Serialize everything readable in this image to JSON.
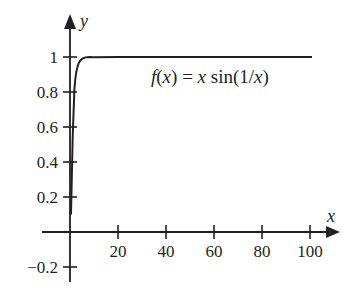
{
  "chart_data": {
    "type": "line",
    "title": "",
    "xlabel": "x",
    "ylabel": "y",
    "xlim": [
      0,
      100
    ],
    "ylim": [
      -0.2,
      1
    ],
    "grid": false,
    "x_ticks": [
      20,
      40,
      60,
      80,
      100
    ],
    "x_tick_labels": [
      "20",
      "40",
      "60",
      "80",
      "100"
    ],
    "y_ticks": [
      -0.2,
      0.2,
      0.4,
      0.6,
      0.8,
      1
    ],
    "y_tick_labels": [
      "−0.2",
      "0.2",
      "0.4",
      "0.6",
      "0.8",
      "1"
    ],
    "series": [
      {
        "name": "f(x) = x sin(1/x)",
        "function": "x*sin(1/x)",
        "x": [
          0.05,
          0.1,
          0.2,
          0.3,
          0.4,
          0.5,
          0.7,
          1,
          1.5,
          2,
          3,
          4,
          5,
          7,
          10,
          20,
          40,
          60,
          80,
          100
        ],
        "values": [
          0.0456,
          -0.0544,
          0.1918,
          0.1145,
          0.2394,
          0.4546,
          0.691,
          0.8415,
          0.9276,
          0.9589,
          0.9816,
          0.9896,
          0.9933,
          0.9966,
          0.9983,
          0.9996,
          0.9999,
          1.0,
          1.0,
          1.0
        ]
      }
    ],
    "annotations": [
      {
        "text": "f(x) = x sin(1/x)",
        "x": 50,
        "y": 0.9
      }
    ],
    "colors": {
      "line": "#231f20",
      "axes": "#231f20"
    }
  },
  "labels": {
    "x_axis": "x",
    "y_axis": "y",
    "formula": "f(x) = x sin(1/x)",
    "formula_parts": {
      "f": "f",
      "lp": "(",
      "x1": "x",
      "rp": ")",
      "eq": " = ",
      "x2": "x",
      "sin": " sin",
      "lp2": "(",
      "one": "1/",
      "x3": "x",
      "rp2": ")"
    }
  }
}
